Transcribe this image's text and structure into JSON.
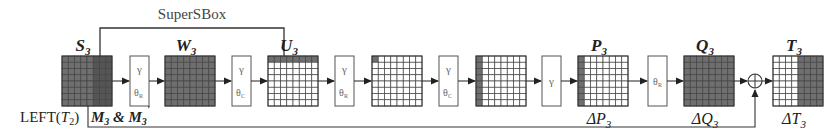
{
  "title": "SuperSBox",
  "colors": {
    "line": "#333333",
    "grid_line": "#444444",
    "cell_dark": "#6f6f6f",
    "cell_light": "#ffffff",
    "box_stroke": "#555555",
    "text": "#222222",
    "box_text": "#666666"
  },
  "labels": {
    "supersbox": "SuperSBox",
    "left_t2": "LEFT(",
    "left_t2_var": "T",
    "left_t2_sub": "2",
    "left_t2_close": ")",
    "m3": "M",
    "m3_sub": "3",
    "amp": " & ",
    "m3p": "M",
    "m3p_sub": "3",
    "m3p_prime": "'"
  },
  "matrices": [
    {
      "id": "S3",
      "name": "S",
      "sub": "3",
      "top_label": true,
      "bottom_label": null,
      "x": 62,
      "pattern": "S3"
    },
    {
      "id": "W3",
      "name": "W",
      "sub": "3",
      "top_label": true,
      "bottom_label": null,
      "x": 165,
      "pattern": "all"
    },
    {
      "id": "U3",
      "name": "U",
      "sub": "3",
      "top_label": true,
      "bottom_label": null,
      "x": 268,
      "pattern": "top_row"
    },
    {
      "id": "M5",
      "name": "",
      "sub": "",
      "top_label": false,
      "bottom_label": null,
      "x": 372,
      "pattern": "top_left"
    },
    {
      "id": "M6",
      "name": "",
      "sub": "",
      "top_label": false,
      "bottom_label": null,
      "x": 476,
      "pattern": "left_col"
    },
    {
      "id": "P3",
      "name": "P",
      "sub": "3",
      "top_label": true,
      "bottom_label": {
        "name": "ΔP",
        "sub": "3"
      },
      "x": 578,
      "pattern": "left_col"
    },
    {
      "id": "Q3",
      "name": "Q",
      "sub": "3",
      "top_label": true,
      "bottom_label": {
        "name": "ΔQ",
        "sub": "3"
      },
      "x": 684,
      "pattern": "all"
    },
    {
      "id": "T3",
      "name": "T",
      "sub": "3",
      "top_label": true,
      "bottom_label": {
        "name": "ΔT",
        "sub": "3"
      },
      "x": 773,
      "pattern": "right_half"
    }
  ],
  "operators": [
    {
      "id": "op1",
      "x": 130,
      "top": "γ",
      "bottom": "θ",
      "bottom_sub": "R"
    },
    {
      "id": "op2",
      "x": 232,
      "top": "γ",
      "bottom": "θ",
      "bottom_sub": "C"
    },
    {
      "id": "op3",
      "x": 335,
      "top": "γ",
      "bottom": "θ",
      "bottom_sub": "R"
    },
    {
      "id": "op4",
      "x": 439,
      "top": "γ",
      "bottom": "θ",
      "bottom_sub": "C"
    },
    {
      "id": "op5",
      "x": 542,
      "top": "γ",
      "bottom": "",
      "bottom_sub": ""
    },
    {
      "id": "op6",
      "x": 648,
      "top": "",
      "bottom": "θ",
      "bottom_sub": "R",
      "center_only": true
    }
  ],
  "xor": {
    "symbol": "⊕",
    "cx": 755,
    "cy": 78
  },
  "grid": {
    "rows": 8,
    "cols": 8,
    "size": 50,
    "top": 56
  }
}
